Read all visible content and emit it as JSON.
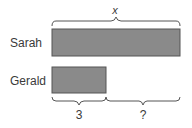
{
  "diagram": {
    "type": "tape-diagram",
    "top_brace_label": "x",
    "rows": [
      {
        "name": "Sarah",
        "bar_color": "#8a8a8a"
      },
      {
        "name": "Gerald",
        "bar_color": "#8a8a8a"
      }
    ],
    "bottom_brace_labels": [
      "3",
      "?"
    ],
    "stroke_color": "#555555"
  }
}
